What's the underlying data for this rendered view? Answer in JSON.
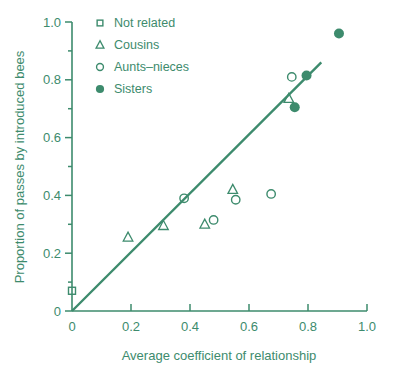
{
  "chart_data": {
    "type": "scatter",
    "title": "",
    "xlabel": "Average coefficient of relationship",
    "ylabel": "Proportion of passes by introduced bees",
    "xlim": [
      0,
      1.0
    ],
    "ylim": [
      0,
      1.0
    ],
    "grid": false,
    "xticks": [
      0,
      0.2,
      0.4,
      0.6,
      0.8,
      1.0
    ],
    "xticklabels": [
      "0",
      "0.2",
      "0.4",
      "0.6",
      "0.8",
      "1.0"
    ],
    "yticks": [
      0,
      0.2,
      0.4,
      0.6,
      0.8,
      1.0
    ],
    "yticklabels": [
      "0",
      "0.2",
      "0.4",
      "0.6",
      "0.8",
      "1.0"
    ],
    "minor_tick_interval": 0.1,
    "legend_position": "top-left",
    "color": "#3d8b6d",
    "series": [
      {
        "name": "Not related",
        "marker": "open-square",
        "points": [
          {
            "x": 0.0,
            "y": 0.07
          }
        ]
      },
      {
        "name": "Cousins",
        "marker": "open-triangle",
        "points": [
          {
            "x": 0.19,
            "y": 0.255
          },
          {
            "x": 0.31,
            "y": 0.295
          },
          {
            "x": 0.45,
            "y": 0.3
          },
          {
            "x": 0.545,
            "y": 0.42
          },
          {
            "x": 0.735,
            "y": 0.735
          }
        ]
      },
      {
        "name": "Aunts–nieces",
        "marker": "open-circle",
        "points": [
          {
            "x": 0.38,
            "y": 0.39
          },
          {
            "x": 0.48,
            "y": 0.315
          },
          {
            "x": 0.555,
            "y": 0.385
          },
          {
            "x": 0.675,
            "y": 0.405
          },
          {
            "x": 0.745,
            "y": 0.81
          }
        ]
      },
      {
        "name": "Sisters",
        "marker": "filled-circle",
        "points": [
          {
            "x": 0.755,
            "y": 0.705
          },
          {
            "x": 0.795,
            "y": 0.815
          },
          {
            "x": 0.905,
            "y": 0.96
          }
        ]
      }
    ],
    "trend_line": {
      "type": "line",
      "x0": 0.0,
      "y0": 0.0,
      "x1": 0.845,
      "y1": 0.86
    }
  },
  "legend": {
    "items": [
      {
        "label": "Not related",
        "marker": "open-square"
      },
      {
        "label": "Cousins",
        "marker": "open-triangle"
      },
      {
        "label": "Aunts–nieces",
        "marker": "open-circle"
      },
      {
        "label": "Sisters",
        "marker": "filled-circle"
      }
    ]
  }
}
